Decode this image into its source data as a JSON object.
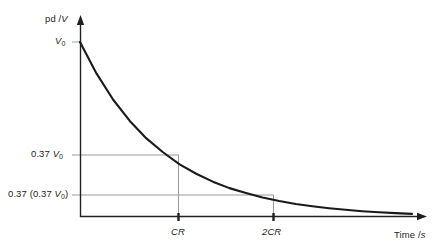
{
  "figure": {
    "background_color": "#ffffff",
    "axis_color": "#231f20",
    "curve_color": "#1a1a1a",
    "gridline_color": "#9a9a9a",
    "text_color": "#231f20"
  },
  "axes": {
    "y": {
      "label_prefix": "pd /",
      "label_unit": "V",
      "origin_px": {
        "x": 80,
        "y": 217
      },
      "arrow_tip_px": {
        "x": 80,
        "y": 16
      }
    },
    "x": {
      "label_prefix": "Time /",
      "label_unit": "s",
      "origin_px": {
        "x": 80,
        "y": 217
      },
      "arrow_tip_px": {
        "x": 427,
        "y": 217
      }
    }
  },
  "y_ticks": [
    {
      "id": "v0",
      "prefix": "",
      "value_mantissa": "",
      "italic": "V",
      "sub": "0",
      "suffix": "",
      "y_px": 42
    },
    {
      "id": "t037",
      "prefix": "0.37 ",
      "value_mantissa": "",
      "italic": "V",
      "sub": "0",
      "suffix": "",
      "y_px": 155
    },
    {
      "id": "t0370",
      "prefix": "0.37 (0.37 ",
      "value_mantissa": "",
      "italic": "V",
      "sub": "0",
      "suffix": ")",
      "y_px": 195
    }
  ],
  "x_ticks": [
    {
      "id": "cr",
      "label": "CR",
      "x_px": 178
    },
    {
      "id": "2cr",
      "label": "2CR",
      "x_px": 273
    }
  ],
  "labels": {
    "y_axis_text": "pd /V",
    "y_v0_text": "V0",
    "y_037v0_text": "0.37 V0",
    "y_037_037v0_text": "0.37 (0.37 V0)",
    "x_cr_text": "CR",
    "x_2cr_text": "2CR",
    "x_axis_text": "Time /s"
  },
  "chart_data": {
    "type": "line",
    "title": "",
    "xlabel": "Time /s",
    "ylabel": "pd /V",
    "grid": true,
    "legend": "none",
    "annotations": [
      "V0 at t = 0",
      "0.37 V0 at t = CR",
      "0.37 (0.37 V0) at t = 2CR"
    ],
    "xlim_units": [
      0,
      4.0
    ],
    "ylim_units": [
      0,
      1.0
    ],
    "x_tick_values": [
      1,
      2
    ],
    "x_tick_labels": [
      "CR",
      "2CR"
    ],
    "y_tick_values": [
      1.0,
      0.37,
      0.1369
    ],
    "y_tick_labels": [
      "V0",
      "0.37 V0",
      "0.37 (0.37 V0)"
    ],
    "series": [
      {
        "name": "V = V0 e^(-t/CR)",
        "x": [
          0,
          0.2,
          0.4,
          0.6,
          0.8,
          1.0,
          1.2,
          1.4,
          1.6,
          1.8,
          2.0,
          2.2,
          2.4,
          2.6,
          2.8,
          3.0,
          3.2,
          3.4,
          3.6,
          3.8,
          4.0
        ],
        "y": [
          1.0,
          0.819,
          0.67,
          0.549,
          0.449,
          0.37,
          0.301,
          0.247,
          0.202,
          0.165,
          0.137,
          0.111,
          0.091,
          0.074,
          0.061,
          0.05,
          0.041,
          0.033,
          0.027,
          0.022,
          0.018
        ]
      }
    ]
  }
}
